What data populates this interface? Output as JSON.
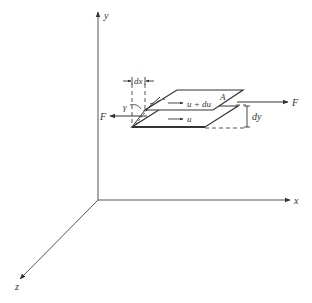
{
  "diagram": {
    "type": "shear-flow-element",
    "axes": {
      "x_label": "x",
      "y_label": "y",
      "z_label": "z"
    },
    "labels": {
      "dx": "dx",
      "dy": "dy",
      "gamma": "γ",
      "area": "A",
      "force_right": "F",
      "force_left": "F",
      "upper_velocity": "u + du",
      "lower_velocity": "u"
    },
    "colors": {
      "line": "#333333",
      "background": "#ffffff"
    }
  }
}
